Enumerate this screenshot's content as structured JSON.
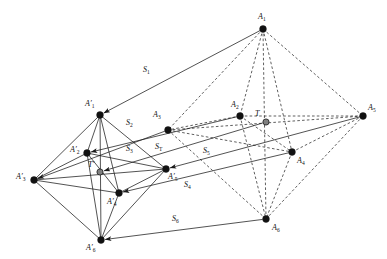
{
  "figure": {
    "background_color": "#ffffff",
    "stroke_color": "#1a1a1a",
    "node_fill": "#111111",
    "special_node_fill": "#808080",
    "width": 387,
    "height": 259
  },
  "chart_data": {
    "type": "diagram",
    "nodes": [
      {
        "id": "A1",
        "label": "A",
        "sub": "1",
        "x": 263,
        "y": 29,
        "fill": "dark",
        "label_x": 258,
        "label_y": 13
      },
      {
        "id": "A2",
        "label": "A",
        "sub": "2",
        "x": 240,
        "y": 116,
        "fill": "dark",
        "label_x": 231,
        "label_y": 101
      },
      {
        "id": "A3",
        "label": "A",
        "sub": "3",
        "x": 168,
        "y": 130,
        "fill": "dark",
        "label_x": 153,
        "label_y": 111
      },
      {
        "id": "A4",
        "label": "A",
        "sub": "4",
        "x": 292,
        "y": 152,
        "fill": "dark",
        "label_x": 297,
        "label_y": 157
      },
      {
        "id": "A5",
        "label": "A",
        "sub": "5",
        "x": 363,
        "y": 116,
        "fill": "dark",
        "label_x": 368,
        "label_y": 104
      },
      {
        "id": "A6",
        "label": "A",
        "sub": "6",
        "x": 266,
        "y": 219,
        "fill": "dark",
        "label_x": 272,
        "label_y": 224
      },
      {
        "id": "T",
        "label": "T",
        "sub": "",
        "x": 266,
        "y": 122,
        "fill": "gray",
        "label_x": 255,
        "label_y": 110
      },
      {
        "id": "A1p",
        "label": "A",
        "sub": "1",
        "prime": true,
        "x": 100,
        "y": 115,
        "fill": "dark",
        "label_x": 85,
        "label_y": 100
      },
      {
        "id": "A2p",
        "label": "A",
        "sub": "2",
        "prime": true,
        "x": 87,
        "y": 153,
        "fill": "dark",
        "label_x": 70,
        "label_y": 146
      },
      {
        "id": "A3p",
        "label": "A",
        "sub": "3",
        "prime": true,
        "x": 34,
        "y": 180,
        "fill": "dark",
        "label_x": 16,
        "label_y": 173
      },
      {
        "id": "A4p",
        "label": "A",
        "sub": "4",
        "prime": true,
        "x": 119,
        "y": 193,
        "fill": "dark",
        "label_x": 107,
        "label_y": 198
      },
      {
        "id": "A5p",
        "label": "A",
        "sub": "5",
        "prime": true,
        "x": 166,
        "y": 169,
        "fill": "dark",
        "label_x": 168,
        "label_y": 173
      },
      {
        "id": "A6p",
        "label": "A",
        "sub": "6",
        "prime": true,
        "x": 101,
        "y": 240,
        "fill": "dark",
        "label_x": 86,
        "label_y": 244
      },
      {
        "id": "Tp",
        "label": "T",
        "sub": "",
        "prime": true,
        "x": 100,
        "y": 172,
        "fill": "gray",
        "label_x": 88,
        "label_y": 161
      }
    ],
    "dashed_edges": [
      [
        "A1",
        "A2"
      ],
      [
        "A1",
        "A3"
      ],
      [
        "A1",
        "A4"
      ],
      [
        "A1",
        "A5"
      ],
      [
        "A1",
        "A6"
      ],
      [
        "A2",
        "A3"
      ],
      [
        "A2",
        "A4"
      ],
      [
        "A2",
        "A5"
      ],
      [
        "A2",
        "A6"
      ],
      [
        "A3",
        "A4"
      ],
      [
        "A3",
        "A5"
      ],
      [
        "A3",
        "A6"
      ],
      [
        "A4",
        "A5"
      ],
      [
        "A4",
        "A6"
      ],
      [
        "A5",
        "A6"
      ]
    ],
    "solid_edges": [
      [
        "A1p",
        "A2p"
      ],
      [
        "A1p",
        "A3p"
      ],
      [
        "A1p",
        "A4p"
      ],
      [
        "A1p",
        "A5p"
      ],
      [
        "A1p",
        "A6p"
      ],
      [
        "A2p",
        "A3p"
      ],
      [
        "A2p",
        "A4p"
      ],
      [
        "A2p",
        "A5p"
      ],
      [
        "A2p",
        "A6p"
      ],
      [
        "A3p",
        "A4p"
      ],
      [
        "A3p",
        "A5p"
      ],
      [
        "A3p",
        "A6p"
      ],
      [
        "A4p",
        "A5p"
      ],
      [
        "A4p",
        "A6p"
      ],
      [
        "A5p",
        "A6p"
      ]
    ],
    "translation_arrows": [
      {
        "id": "S1",
        "label": "S",
        "sub": "1",
        "from": "A1",
        "to": "A1p",
        "label_x": 143,
        "label_y": 66
      },
      {
        "id": "S2",
        "label": "S",
        "sub": "2",
        "from": "A2",
        "to": "A2p",
        "label_x": 126,
        "label_y": 119
      },
      {
        "id": "S3",
        "label": "S",
        "sub": "3",
        "from": "A3",
        "to": "A3p",
        "label_x": 126,
        "label_y": 145
      },
      {
        "id": "ST",
        "label": "S",
        "sub": "T",
        "from": "T",
        "to": "Tp",
        "label_x": 155,
        "label_y": 143
      },
      {
        "id": "S5",
        "label": "S",
        "sub": "5",
        "from": "A5",
        "to": "A5p",
        "label_x": 203,
        "label_y": 147
      },
      {
        "id": "S4",
        "label": "S",
        "sub": "4",
        "from": "A4",
        "to": "A4p",
        "label_x": 184,
        "label_y": 181
      },
      {
        "id": "S6",
        "label": "S",
        "sub": "6",
        "from": "A6",
        "to": "A6p",
        "label_x": 172,
        "label_y": 215
      }
    ]
  }
}
